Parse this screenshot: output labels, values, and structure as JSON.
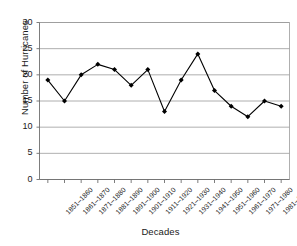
{
  "chart_data": {
    "type": "line",
    "title": "",
    "xlabel": "Decades",
    "ylabel": "Number of Hurricanes",
    "categories": [
      "1851–1860",
      "1861–1870",
      "1871–1880",
      "1881–1890",
      "1891–1900",
      "1901–1910",
      "1911–1920",
      "1921–1930",
      "1931–1940",
      "1941–1950",
      "1951–1960",
      "1961–1970",
      "1971–1980",
      "1981–1990",
      "1991–2000"
    ],
    "values": [
      19,
      15,
      20,
      22,
      21,
      18,
      21,
      13,
      19,
      24,
      17,
      14,
      12,
      15,
      14
    ],
    "ylim": [
      0,
      30
    ],
    "ytick_labels": [
      "0",
      "5",
      "10",
      "15",
      "20",
      "25",
      "30"
    ],
    "ytick_values": [
      0,
      5,
      10,
      15,
      20,
      25,
      30
    ],
    "grid": "horizontal",
    "legend": "none",
    "marker": "filled-diamond",
    "line_color": "#000000",
    "marker_color": "#000000",
    "grid_color": "#9a9a9a",
    "axis_color": "#6e6e6e",
    "background": "#ffffff"
  },
  "axes": {
    "y_title": "Number of Hurricanes",
    "x_title": "Decades"
  }
}
